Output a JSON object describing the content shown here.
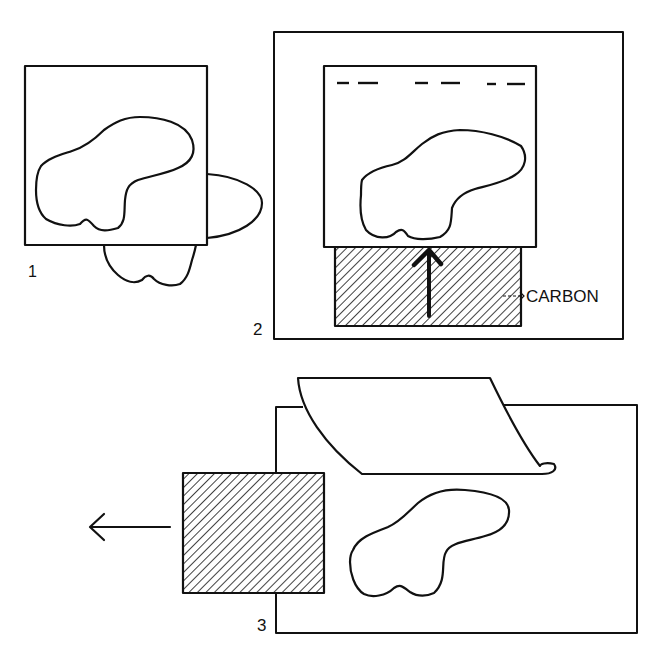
{
  "diagram": {
    "stroke_color": "#111111",
    "background": "#ffffff",
    "panels": [
      {
        "id": "1",
        "label": "1",
        "description": "Tracing sheet over drawing with shape; second shape partially underneath"
      },
      {
        "id": "2",
        "label": "2",
        "description": "Carbon sheet slid under tracing; arrow pointing up",
        "callout": "CARBON"
      },
      {
        "id": "3",
        "label": "3",
        "description": "Top sheet peeled back, carbon pulled out to the left; transferred shape remains"
      }
    ]
  }
}
